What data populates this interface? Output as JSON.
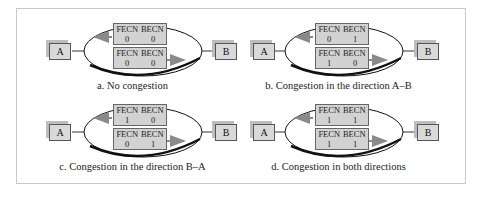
{
  "panels": [
    {
      "id": "a",
      "caption": "a. No congestion",
      "node_left": "A",
      "node_right": "B",
      "frame_top": {
        "fecn_label": "FECN",
        "becn_label": "BECN",
        "fecn": "0",
        "becn": "0",
        "direction": "B to A"
      },
      "frame_bottom": {
        "fecn_label": "FECN",
        "becn_label": "BECN",
        "fecn": "0",
        "becn": "0",
        "direction": "A to B"
      }
    },
    {
      "id": "b",
      "caption": "b. Congestion in the direction A–B",
      "node_left": "A",
      "node_right": "B",
      "frame_top": {
        "fecn_label": "FECN",
        "becn_label": "BECN",
        "fecn": "0",
        "becn": "1",
        "direction": "B to A"
      },
      "frame_bottom": {
        "fecn_label": "FECN",
        "becn_label": "BECN",
        "fecn": "1",
        "becn": "0",
        "direction": "A to B"
      }
    },
    {
      "id": "c",
      "caption": "c. Congestion in the direction B–A",
      "node_left": "A",
      "node_right": "B",
      "frame_top": {
        "fecn_label": "FECN",
        "becn_label": "BECN",
        "fecn": "1",
        "becn": "0",
        "direction": "B to A"
      },
      "frame_bottom": {
        "fecn_label": "FECN",
        "becn_label": "BECN",
        "fecn": "0",
        "becn": "1",
        "direction": "A to B"
      }
    },
    {
      "id": "d",
      "caption": "d. Congestion in both directions",
      "node_left": "A",
      "node_right": "B",
      "frame_top": {
        "fecn_label": "FECN",
        "becn_label": "BECN",
        "fecn": "1",
        "becn": "1",
        "direction": "B to A"
      },
      "frame_bottom": {
        "fecn_label": "FECN",
        "becn_label": "BECN",
        "fecn": "1",
        "becn": "1",
        "direction": "A to B"
      }
    }
  ],
  "colors": {
    "box_fill": "#d2d2d2",
    "arrow": "#8a8a8a",
    "border": "#c8c8c8"
  }
}
